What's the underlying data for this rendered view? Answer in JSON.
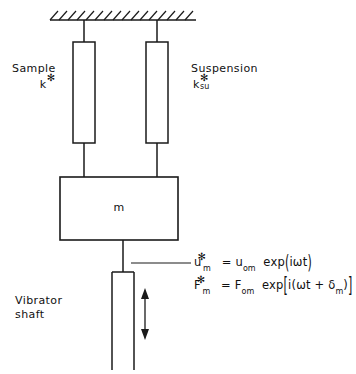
{
  "figure": {
    "type": "mechanical-vibration-model-diagram",
    "background_color": "#ffffff",
    "line_color": "#1a1a1a"
  },
  "labels": {
    "sample_name": "Sample",
    "sample_symbol_base": "k",
    "sample_symbol_superscript": "✻",
    "suspension_name": "Suspension",
    "suspension_symbol_base": "k",
    "suspension_symbol_superscript": "✻",
    "suspension_symbol_subscript": "su",
    "mass_symbol": "m",
    "vibrator_line1": "Vibrator",
    "vibrator_line2": "shaft"
  },
  "equations": {
    "displacement": {
      "lhs_base": "u",
      "lhs_superscript": "✻",
      "lhs_subscript": "m",
      "equals": "=",
      "rhs_amplitude_base": "u",
      "rhs_amplitude_subscript": "om",
      "exp_label": "exp",
      "open_paren": "(",
      "argument": "iωt",
      "close_paren": ")",
      "plain_text": "u*_m = u_om exp(iωt)"
    },
    "force": {
      "lhs_base": "F",
      "lhs_superscript": "✻",
      "lhs_subscript": "m",
      "equals": "=",
      "rhs_amplitude_base": "F",
      "rhs_amplitude_subscript": "om",
      "exp_label": "exp",
      "open_bracket": "[",
      "argument_prefix": "i(ωt + ",
      "argument_delta": "δ",
      "argument_delta_subscript": "m",
      "argument_suffix": ")",
      "close_bracket": "]",
      "plain_text": "F*_m = F_om exp[i(ωt + δ_m)]"
    }
  },
  "geometry": {
    "ceiling": {
      "x1": 50,
      "x2": 196,
      "y": 20,
      "hatch_count": 16
    },
    "sample_spring_box": {
      "x": 73,
      "y": 42,
      "width": 22,
      "height": 101
    },
    "suspension_spring_box": {
      "x": 146,
      "y": 42,
      "width": 22,
      "height": 101
    },
    "mass_box": {
      "x": 60,
      "y": 177,
      "width": 118,
      "height": 63
    },
    "shaft_box": {
      "x": 112,
      "y": 272,
      "width": 22,
      "height": 98
    },
    "motion_arrow": {
      "x": 145,
      "y_top": 292,
      "y_bottom": 336
    },
    "leader_line": {
      "x1": 131,
      "x2": 191,
      "y": 263
    }
  }
}
